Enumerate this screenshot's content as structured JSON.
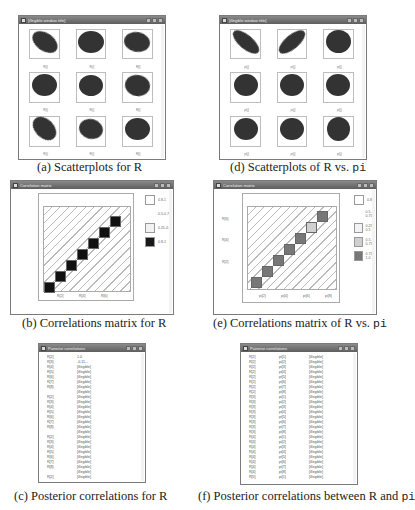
{
  "panels": {
    "a": {
      "window_title": "[illegible window title]",
      "caption_prefix": "(a) Scatterplots for ",
      "caption_var": "R",
      "x_label": "R[i]",
      "blobs": [
        {
          "rot": 35,
          "w": 28,
          "h": 18
        },
        {
          "rot": 0,
          "w": 26,
          "h": 22
        },
        {
          "rot": 10,
          "w": 26,
          "h": 20
        },
        {
          "rot": 0,
          "w": 25,
          "h": 22
        },
        {
          "rot": 0,
          "w": 24,
          "h": 21
        },
        {
          "rot": 10,
          "w": 25,
          "h": 21
        },
        {
          "rot": 45,
          "w": 27,
          "h": 19
        },
        {
          "rot": 15,
          "w": 24,
          "h": 20
        },
        {
          "rot": 0,
          "w": 25,
          "h": 22
        }
      ]
    },
    "d": {
      "window_title": "[illegible window title]",
      "caption_prefix": "(d) Scatterplots of ",
      "caption_var": "R",
      "caption_mid": "vs. ",
      "caption_var2": "pi",
      "x_label": "pi[j]",
      "blobs": [
        {
          "rot": 40,
          "w": 32,
          "h": 14
        },
        {
          "rot": -40,
          "w": 32,
          "h": 14
        },
        {
          "rot": 0,
          "w": 25,
          "h": 23
        },
        {
          "rot": 0,
          "w": 24,
          "h": 22
        },
        {
          "rot": 0,
          "w": 24,
          "h": 22
        },
        {
          "rot": 0,
          "w": 24,
          "h": 22
        },
        {
          "rot": 0,
          "w": 24,
          "h": 22
        },
        {
          "rot": 0,
          "w": 24,
          "h": 22
        },
        {
          "rot": 0,
          "w": 23,
          "h": 24
        }
      ]
    },
    "b": {
      "window_title": "Correlation matrix",
      "caption_prefix": "(b) Correlations matrix for ",
      "caption_var": "R",
      "x_ticks": [
        "R[2]",
        "R[4]",
        "R[6]"
      ],
      "legend": [
        {
          "label": "0.8-1",
          "color": "#ffffff",
          "note": "approximate"
        },
        {
          "label": "0.5-0.75",
          "color": "#ffffff",
          "note": "approximate"
        },
        {
          "label": "0.25-0.5",
          "color": "#f2f2f2",
          "note": "approximate"
        },
        {
          "label": "0.8-1",
          "color": "#1a1a1a",
          "note": "approximate"
        }
      ]
    },
    "e": {
      "window_title": "Correlation matrix",
      "caption_prefix": "(e) Correlations matrix of ",
      "caption_var": "R",
      "caption_mid": "vs. ",
      "caption_var2": "pi",
      "x_ticks": [
        "pi[2]",
        "pi[4]",
        "pi[6]",
        "pi[8]"
      ],
      "y_ticks": [
        "R[2]",
        "R[4]",
        "R[6]"
      ],
      "legend": [
        {
          "label": "0.8-1",
          "color": "#ffffff",
          "note": "approximate"
        },
        {
          "label": "0.5-0.75",
          "color": "#ffffff",
          "note": "approximate"
        },
        {
          "label": "0.25-0.5",
          "color": "#f2f2f2",
          "note": "approximate"
        },
        {
          "label": "0.5-0.75",
          "color": "#d0d0d0",
          "note": "approximate"
        },
        {
          "label": "0.75-1.0",
          "color": "#777777",
          "note": "approximate"
        }
      ]
    },
    "c": {
      "window_title": "Pairwise correlations",
      "caption_prefix": "(c) Posterior correlations for ",
      "caption_var": "R",
      "values_note": "Only the first value (1.0) and the sign/leading digits of the second (-0.11...) are legible. All other values are placeholders.",
      "rows": [
        [
          "R[2]",
          "1.0"
        ],
        [
          "R[3]",
          "-0.11..."
        ],
        [
          "R[4]",
          "[illegible]"
        ],
        [
          "R[5]",
          "[illegible]"
        ],
        [
          "R[6]",
          "[illegible]"
        ],
        [
          "R[7]",
          "[illegible]"
        ],
        [
          "R[8]",
          "[illegible]"
        ],
        [
          "",
          "[illegible]"
        ],
        [
          "R[2]",
          "[illegible]"
        ],
        [
          "R[3]",
          "[illegible]"
        ],
        [
          "R[4]",
          "[illegible]"
        ],
        [
          "R[5]",
          "[illegible]"
        ],
        [
          "R[6]",
          "[illegible]"
        ],
        [
          "R[7]",
          "[illegible]"
        ],
        [
          "R[8]",
          "[illegible]"
        ],
        [
          "",
          "[illegible]"
        ],
        [
          "R[2]",
          "[illegible]"
        ],
        [
          "R[3]",
          "[illegible]"
        ],
        [
          "R[4]",
          "[illegible]"
        ],
        [
          "R[5]",
          "[illegible]"
        ],
        [
          "R[6]",
          "[illegible]"
        ],
        [
          "R[7]",
          "[illegible]"
        ],
        [
          "R[8]",
          "[illegible]"
        ],
        [
          "",
          "[illegible]"
        ],
        [
          "R[2]",
          "[illegible]"
        ]
      ]
    },
    "f": {
      "window_title": "Pairwise correlations",
      "caption_prefix": "(f) Posterior correlations between ",
      "caption_var": "R",
      "caption_mid": "and ",
      "caption_var2": "pi",
      "values_note": "Row/column labels and all numeric values are illegible at this resolution. Placeholders only.",
      "rows": [
        [
          "R[2]",
          "pi[1]",
          "[illegible]"
        ],
        [
          "R[2]",
          "pi[2]",
          "[illegible]"
        ],
        [
          "R[2]",
          "pi[3]",
          "[illegible]"
        ],
        [
          "R[2]",
          "pi[4]",
          "[illegible]"
        ],
        [
          "R[2]",
          "pi[5]",
          "[illegible]"
        ],
        [
          "R[2]",
          "pi[6]",
          "[illegible]"
        ],
        [
          "R[2]",
          "pi[7]",
          "[illegible]"
        ],
        [
          "R[2]",
          "pi[8]",
          "[illegible]"
        ],
        [
          "R[3]",
          "pi[1]",
          "[illegible]"
        ],
        [
          "R[3]",
          "pi[2]",
          "[illegible]"
        ],
        [
          "R[3]",
          "pi[3]",
          "[illegible]"
        ],
        [
          "R[3]",
          "pi[4]",
          "[illegible]"
        ],
        [
          "R[3]",
          "pi[5]",
          "[illegible]"
        ],
        [
          "R[3]",
          "pi[6]",
          "[illegible]"
        ],
        [
          "R[3]",
          "pi[7]",
          "[illegible]"
        ],
        [
          "R[3]",
          "pi[8]",
          "[illegible]"
        ],
        [
          "R[4]",
          "pi[1]",
          "[illegible]"
        ],
        [
          "R[4]",
          "pi[2]",
          "[illegible]"
        ],
        [
          "R[4]",
          "pi[3]",
          "[illegible]"
        ],
        [
          "R[4]",
          "pi[4]",
          "[illegible]"
        ],
        [
          "R[4]",
          "pi[5]",
          "[illegible]"
        ],
        [
          "R[4]",
          "pi[6]",
          "[illegible]"
        ],
        [
          "R[4]",
          "pi[7]",
          "[illegible]"
        ],
        [
          "R[4]",
          "pi[8]",
          "[illegible]"
        ],
        [
          "R[5]",
          "pi[1]",
          "[illegible]"
        ]
      ]
    }
  }
}
